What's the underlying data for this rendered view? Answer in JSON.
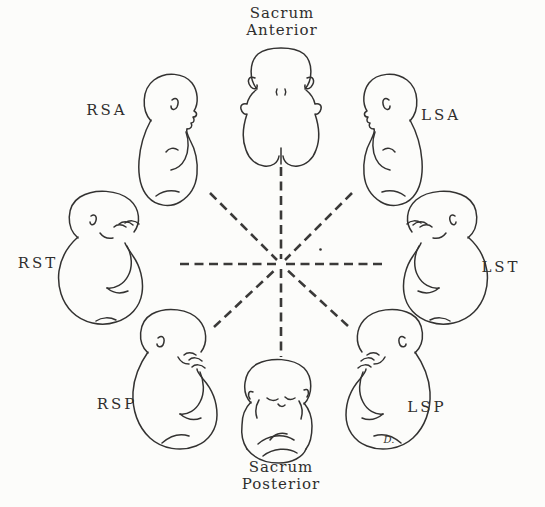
{
  "figure": {
    "titles": {
      "top": {
        "line1": "Sacrum",
        "line2": "Anterior"
      },
      "bottom": {
        "line1": "Sacrum",
        "line2": "Posterior"
      }
    },
    "labels": {
      "rsa": "RSA",
      "lsa": "LSA",
      "rst": "RST",
      "lst": "LST",
      "rsp": "RSP",
      "lsp": "LSP"
    },
    "signature": "D.",
    "colors": {
      "ink": "#333231",
      "paper": "#fcfcfa"
    },
    "illustrations": [
      {
        "id": "sacrum-anterior-fetus",
        "view": "back view, head up"
      },
      {
        "id": "rsa-fetus",
        "view": "profile head up, facing right"
      },
      {
        "id": "lsa-fetus",
        "view": "profile head up, facing left"
      },
      {
        "id": "rst-fetus",
        "view": "curled transverse, facing right"
      },
      {
        "id": "lst-fetus",
        "view": "curled transverse, facing left"
      },
      {
        "id": "rsp-fetus",
        "view": "curled, facing right"
      },
      {
        "id": "lsp-fetus",
        "view": "curled, facing left"
      },
      {
        "id": "sacrum-posterior-fetus",
        "view": "front view, flexed, head down"
      }
    ]
  }
}
